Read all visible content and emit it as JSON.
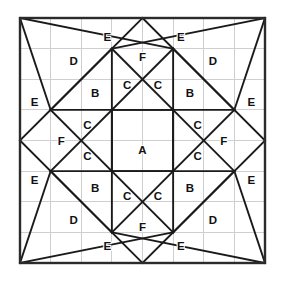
{
  "figure": {
    "square": {
      "x": 20,
      "y": 18,
      "size": 245,
      "divisions": 8,
      "cell": 30.625
    },
    "colors": {
      "background": "#ffffff",
      "grid": "#cfcfcf",
      "figure_stroke": "#1a1a1a",
      "border_stroke": "#2b2b2b",
      "label_fill": "#111111"
    },
    "grid": {
      "visible": true,
      "vertical_ticks": [
        0,
        1,
        2,
        3,
        4,
        5,
        6,
        7,
        8
      ],
      "horizontal_ticks": [
        0,
        1,
        2,
        3,
        4,
        5,
        6,
        7,
        8
      ]
    },
    "key_vertices": [
      {
        "name": "top-left-corner",
        "u": 0,
        "v": 0
      },
      {
        "name": "top-mid",
        "u": 4,
        "v": 0
      },
      {
        "name": "top-right-corner",
        "u": 8,
        "v": 0
      },
      {
        "name": "node-3-1",
        "u": 3,
        "v": 1
      },
      {
        "name": "node-5-1",
        "u": 5,
        "v": 1
      },
      {
        "name": "node-1-3",
        "u": 1,
        "v": 3
      },
      {
        "name": "node-7-3",
        "u": 7,
        "v": 3
      },
      {
        "name": "left-mid",
        "u": 0,
        "v": 4
      },
      {
        "name": "center",
        "u": 4,
        "v": 4
      },
      {
        "name": "right-mid",
        "u": 8,
        "v": 4
      },
      {
        "name": "node-1-5",
        "u": 1,
        "v": 5
      },
      {
        "name": "node-7-5",
        "u": 7,
        "v": 5
      },
      {
        "name": "node-3-7",
        "u": 3,
        "v": 7
      },
      {
        "name": "node-5-7",
        "u": 5,
        "v": 7
      },
      {
        "name": "bottom-left-corner",
        "u": 0,
        "v": 8
      },
      {
        "name": "bottom-mid",
        "u": 4,
        "v": 8
      },
      {
        "name": "bottom-right-corner",
        "u": 8,
        "v": 8
      }
    ],
    "segments": [
      {
        "name": "diag-tl-center",
        "x1": 1,
        "y1": 3,
        "x2": 4,
        "y2": 0
      },
      {
        "name": "diag-tr-center",
        "x1": 4,
        "y1": 0,
        "x2": 7,
        "y2": 3
      },
      {
        "name": "diag-bl-center",
        "x1": 1,
        "y1": 5,
        "x2": 4,
        "y2": 8
      },
      {
        "name": "diag-br-center",
        "x1": 4,
        "y1": 8,
        "x2": 7,
        "y2": 5
      },
      {
        "name": "diag-left-upper",
        "x1": 0,
        "y1": 4,
        "x2": 3,
        "y2": 1
      },
      {
        "name": "diag-left-lower",
        "x1": 0,
        "y1": 4,
        "x2": 3,
        "y2": 7
      },
      {
        "name": "diag-right-upper",
        "x1": 8,
        "y1": 4,
        "x2": 5,
        "y2": 1
      },
      {
        "name": "diag-right-lower",
        "x1": 8,
        "y1": 4,
        "x2": 5,
        "y2": 7
      },
      {
        "name": "long-diag-tl",
        "x1": 1,
        "y1": 3,
        "x2": 5,
        "y2": 7
      },
      {
        "name": "long-diag-tr",
        "x1": 7,
        "y1": 3,
        "x2": 3,
        "y2": 7
      },
      {
        "name": "long-diag-bl",
        "x1": 1,
        "y1": 5,
        "x2": 5,
        "y2": 1
      },
      {
        "name": "long-diag-br",
        "x1": 7,
        "y1": 5,
        "x2": 3,
        "y2": 1
      },
      {
        "name": "corner-tl-a",
        "x1": 0,
        "y1": 0,
        "x2": 1,
        "y2": 3
      },
      {
        "name": "corner-tl-b",
        "x1": 0,
        "y1": 0,
        "x2": 5,
        "y2": 1
      },
      {
        "name": "corner-tr-a",
        "x1": 8,
        "y1": 0,
        "x2": 7,
        "y2": 3
      },
      {
        "name": "corner-tr-b",
        "x1": 8,
        "y1": 0,
        "x2": 3,
        "y2": 1
      },
      {
        "name": "corner-bl-a",
        "x1": 0,
        "y1": 8,
        "x2": 1,
        "y2": 5
      },
      {
        "name": "corner-bl-b",
        "x1": 0,
        "y1": 8,
        "x2": 5,
        "y2": 7
      },
      {
        "name": "corner-br-a",
        "x1": 8,
        "y1": 8,
        "x2": 7,
        "y2": 5
      },
      {
        "name": "corner-br-b",
        "x1": 8,
        "y1": 8,
        "x2": 3,
        "y2": 7
      },
      {
        "name": "chord-top-left",
        "x1": 1,
        "y1": 3,
        "x2": 5,
        "y2": 3
      },
      {
        "name": "chord-top-right",
        "x1": 3,
        "y1": 3,
        "x2": 7,
        "y2": 3
      },
      {
        "name": "chord-bot-left",
        "x1": 1,
        "y1": 5,
        "x2": 5,
        "y2": 5
      },
      {
        "name": "chord-bot-right",
        "x1": 3,
        "y1": 5,
        "x2": 7,
        "y2": 5
      },
      {
        "name": "vert-left-top",
        "x1": 3,
        "y1": 1,
        "x2": 3,
        "y2": 5
      },
      {
        "name": "vert-right-top",
        "x1": 5,
        "y1": 1,
        "x2": 5,
        "y2": 5
      },
      {
        "name": "vert-left-bot",
        "x1": 3,
        "y1": 3,
        "x2": 3,
        "y2": 7
      },
      {
        "name": "vert-right-bot",
        "x1": 5,
        "y1": 3,
        "x2": 5,
        "y2": 7
      }
    ],
    "labels": [
      {
        "id": "label-a-center",
        "text": "A",
        "u": 4.0,
        "v": 4.3
      },
      {
        "id": "label-b-top-left",
        "text": "B",
        "u": 2.45,
        "v": 2.45
      },
      {
        "id": "label-b-top-right",
        "text": "B",
        "u": 5.55,
        "v": 2.45
      },
      {
        "id": "label-b-bottom-left",
        "text": "B",
        "u": 2.45,
        "v": 5.55
      },
      {
        "id": "label-b-bottom-right",
        "text": "B",
        "u": 5.55,
        "v": 5.55
      },
      {
        "id": "label-c-top-left",
        "text": "C",
        "u": 3.5,
        "v": 2.2
      },
      {
        "id": "label-c-top-right",
        "text": "C",
        "u": 4.5,
        "v": 2.2
      },
      {
        "id": "label-c-left-upper",
        "text": "C",
        "u": 2.2,
        "v": 3.5
      },
      {
        "id": "label-c-right-upper",
        "text": "C",
        "u": 5.8,
        "v": 3.5
      },
      {
        "id": "label-c-left-lower",
        "text": "C",
        "u": 2.2,
        "v": 4.5
      },
      {
        "id": "label-c-right-lower",
        "text": "C",
        "u": 5.8,
        "v": 4.5
      },
      {
        "id": "label-c-bottom-left",
        "text": "C",
        "u": 3.5,
        "v": 5.8
      },
      {
        "id": "label-c-bottom-right",
        "text": "C",
        "u": 4.5,
        "v": 5.8
      },
      {
        "id": "label-d-top-left",
        "text": "D",
        "u": 1.75,
        "v": 1.4
      },
      {
        "id": "label-d-top-right",
        "text": "D",
        "u": 6.3,
        "v": 1.4
      },
      {
        "id": "label-d-bottom-left",
        "text": "D",
        "u": 1.75,
        "v": 6.6
      },
      {
        "id": "label-d-bottom-right",
        "text": "D",
        "u": 6.3,
        "v": 6.6
      },
      {
        "id": "label-e-top-left",
        "text": "E",
        "u": 2.85,
        "v": 0.62
      },
      {
        "id": "label-e-top-right",
        "text": "E",
        "u": 5.25,
        "v": 0.62
      },
      {
        "id": "label-e-left-top",
        "text": "E",
        "u": 0.48,
        "v": 2.75
      },
      {
        "id": "label-e-right-top",
        "text": "E",
        "u": 7.55,
        "v": 2.75
      },
      {
        "id": "label-e-left-bottom",
        "text": "E",
        "u": 0.48,
        "v": 5.3
      },
      {
        "id": "label-e-right-bottom",
        "text": "E",
        "u": 7.55,
        "v": 5.3
      },
      {
        "id": "label-e-bottom-left",
        "text": "E",
        "u": 2.85,
        "v": 7.45
      },
      {
        "id": "label-e-bottom-right",
        "text": "E",
        "u": 5.25,
        "v": 7.45
      },
      {
        "id": "label-f-top",
        "text": "F",
        "u": 4.0,
        "v": 1.28
      },
      {
        "id": "label-f-left",
        "text": "F",
        "u": 1.35,
        "v": 4.0
      },
      {
        "id": "label-f-right",
        "text": "F",
        "u": 6.65,
        "v": 4.0
      },
      {
        "id": "label-f-bottom",
        "text": "F",
        "u": 4.0,
        "v": 6.82
      }
    ]
  }
}
